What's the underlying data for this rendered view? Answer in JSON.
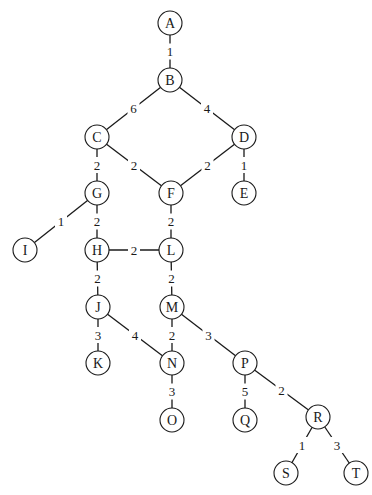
{
  "diagram": {
    "type": "weighted-undirected-graph",
    "node_radius": 12,
    "nodes": [
      {
        "id": "A",
        "label": "A",
        "x": 170,
        "y": 23
      },
      {
        "id": "B",
        "label": "B",
        "x": 170,
        "y": 80
      },
      {
        "id": "C",
        "label": "C",
        "x": 97,
        "y": 137
      },
      {
        "id": "D",
        "label": "D",
        "x": 244,
        "y": 137
      },
      {
        "id": "E",
        "label": "E",
        "x": 244,
        "y": 193
      },
      {
        "id": "F",
        "label": "F",
        "x": 171,
        "y": 193
      },
      {
        "id": "G",
        "label": "G",
        "x": 97,
        "y": 193
      },
      {
        "id": "I",
        "label": "I",
        "x": 25,
        "y": 250
      },
      {
        "id": "H",
        "label": "H",
        "x": 97,
        "y": 250
      },
      {
        "id": "L",
        "label": "L",
        "x": 171,
        "y": 250
      },
      {
        "id": "J",
        "label": "J",
        "x": 98,
        "y": 307
      },
      {
        "id": "M",
        "label": "M",
        "x": 172,
        "y": 307
      },
      {
        "id": "K",
        "label": "K",
        "x": 98,
        "y": 363
      },
      {
        "id": "N",
        "label": "N",
        "x": 172,
        "y": 363
      },
      {
        "id": "P",
        "label": "P",
        "x": 245,
        "y": 363
      },
      {
        "id": "O",
        "label": "O",
        "x": 172,
        "y": 420
      },
      {
        "id": "Q",
        "label": "Q",
        "x": 245,
        "y": 420
      },
      {
        "id": "R",
        "label": "R",
        "x": 318,
        "y": 417
      },
      {
        "id": "S",
        "label": "S",
        "x": 286,
        "y": 473
      },
      {
        "id": "T",
        "label": "T",
        "x": 356,
        "y": 473
      }
    ],
    "edges": [
      {
        "from": "A",
        "to": "B",
        "weight": "1"
      },
      {
        "from": "B",
        "to": "C",
        "weight": "6"
      },
      {
        "from": "B",
        "to": "D",
        "weight": "4"
      },
      {
        "from": "C",
        "to": "G",
        "weight": "2"
      },
      {
        "from": "C",
        "to": "F",
        "weight": "2"
      },
      {
        "from": "D",
        "to": "F",
        "weight": "2"
      },
      {
        "from": "D",
        "to": "E",
        "weight": "1"
      },
      {
        "from": "G",
        "to": "I",
        "weight": "1"
      },
      {
        "from": "G",
        "to": "H",
        "weight": "2"
      },
      {
        "from": "F",
        "to": "L",
        "weight": "2"
      },
      {
        "from": "H",
        "to": "L",
        "weight": "2"
      },
      {
        "from": "H",
        "to": "J",
        "weight": "2"
      },
      {
        "from": "L",
        "to": "M",
        "weight": "2"
      },
      {
        "from": "J",
        "to": "K",
        "weight": "3"
      },
      {
        "from": "J",
        "to": "N",
        "weight": "4"
      },
      {
        "from": "M",
        "to": "N",
        "weight": "2"
      },
      {
        "from": "M",
        "to": "P",
        "weight": "3"
      },
      {
        "from": "N",
        "to": "O",
        "weight": "3"
      },
      {
        "from": "P",
        "to": "Q",
        "weight": "5"
      },
      {
        "from": "P",
        "to": "R",
        "weight": "2"
      },
      {
        "from": "R",
        "to": "S",
        "weight": "1"
      },
      {
        "from": "R",
        "to": "T",
        "weight": "3"
      }
    ]
  }
}
